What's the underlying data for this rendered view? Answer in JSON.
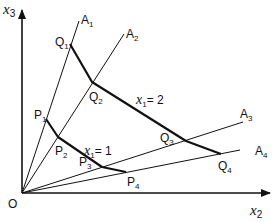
{
  "diagram": {
    "title": "",
    "colors": {
      "ink": "#111111",
      "background": "#ffffff"
    },
    "axes": {
      "vertical_label": "x",
      "vertical_sub": "3",
      "horizontal_label": "x",
      "horizontal_sub": "2",
      "origin_label": "O"
    },
    "rays": [
      {
        "label": "A",
        "sub": "1"
      },
      {
        "label": "A",
        "sub": "2"
      },
      {
        "label": "A",
        "sub": "3"
      },
      {
        "label": "A",
        "sub": "4"
      }
    ],
    "isoquant_outer": {
      "label": "x",
      "sub": "1",
      "value": "= 2",
      "points": [
        {
          "label": "Q",
          "sub": "1"
        },
        {
          "label": "Q",
          "sub": "2"
        },
        {
          "label": "Q",
          "sub": "3"
        },
        {
          "label": "Q",
          "sub": "4"
        }
      ]
    },
    "isoquant_inner": {
      "label": "x",
      "sub": "1",
      "value": "= 1",
      "points": [
        {
          "label": "P",
          "sub": "1"
        },
        {
          "label": "P",
          "sub": "2"
        },
        {
          "label": "P",
          "sub": "3"
        },
        {
          "label": "P",
          "sub": "4"
        }
      ]
    }
  }
}
